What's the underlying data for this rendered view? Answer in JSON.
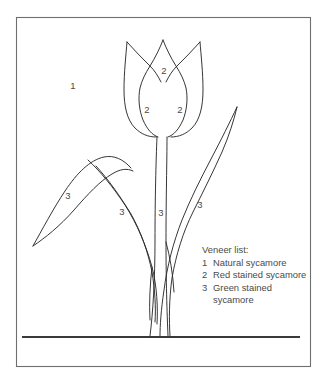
{
  "document": {
    "title": "Tulip marquetry pattern",
    "type": "line-drawing"
  },
  "colors": {
    "outline": "#2b2b2b",
    "frame": "#6d6f71",
    "ground": "#3a3a3a",
    "label_text": "#4a4a4a",
    "background": "#ffffff"
  },
  "frame": {
    "x": 16,
    "y": 17,
    "width": 295,
    "height": 350
  },
  "ground": {
    "x1": 22,
    "x2": 300,
    "y": 337
  },
  "region_labels": [
    {
      "id": "background-region",
      "text": "1",
      "x": 73,
      "y": 86
    },
    {
      "id": "petal-center-top",
      "text": "2",
      "x": 164,
      "y": 71
    },
    {
      "id": "petal-left",
      "text": "2",
      "x": 147,
      "y": 110
    },
    {
      "id": "petal-right",
      "text": "2",
      "x": 180,
      "y": 110
    },
    {
      "id": "leaf-far-left",
      "text": "3",
      "x": 68,
      "y": 196
    },
    {
      "id": "leaf-left",
      "text": "3",
      "x": 122,
      "y": 212
    },
    {
      "id": "stem",
      "text": "3",
      "x": 161,
      "y": 213
    },
    {
      "id": "leaf-right",
      "text": "3",
      "x": 200,
      "y": 205
    }
  ],
  "legend": {
    "title": "Veneer list:",
    "items": [
      {
        "number": "1",
        "label": "Natural sycamore"
      },
      {
        "number": "2",
        "label": "Red stained sycamore"
      },
      {
        "number": "3",
        "label": "Green stained sycamore"
      }
    ]
  },
  "shapes": {
    "tulip_petal_left_outer": "M 127 42 C 126 55 124 72 124 90 C 124 106 127 120 135 128 C 141 134 148 137 156 137",
    "tulip_petal_right_outer": "M 200 42 C 201 55 203 72 203 90 C 203 106 200 120 192 128 C 186 134 179 137 171 137",
    "tulip_notch_left": "M 127 42 C 134 50 142 58 150 66 C 155 71 158 76 161 81",
    "tulip_notch_right": "M 200 42 C 193 50 185 58 177 66 C 172 71 169 76 166 81",
    "tulip_center_petal_left": "M 163 40 C 160 48 155 58 150 66 C 145 74 142 80 140 88 C 138 98 139 110 143 120 C 147 129 152 135 158 137",
    "tulip_center_petal_right": "M 163 40 C 166 48 171 58 176 66 C 181 74 184 80 186 88 C 188 98 187 110 183 120 C 179 129 174 135 168 137",
    "stem_left": "M 157 137 C 156 160 155 200 155 240 C 155 280 153 310 150 336",
    "stem_right": "M 167 137 C 167 160 166 200 166 240 C 166 280 167 310 168 336",
    "leaf_right": "M 237 107 C 234 120 229 136 222 152 C 213 172 203 192 193 212 C 183 232 176 255 172 278 C 169 300 169 320 170 336",
    "leaf_right_inner": "M 237 107 C 230 122 221 140 211 159 C 200 180 190 200 182 220 C 173 243 167 267 164 290 C 161 310 160 326 160 336",
    "leaf_left_upper": "M 33 246 C 42 230 53 209 65 191 C 77 173 90 160 104 157 C 114 155 123 159 131 168",
    "leaf_left_upper_inner": "M 33 246 C 45 238 60 225 74 209 C 88 193 100 180 112 173 C 120 168 127 167 133 170",
    "leaf_left_lower": "M 88 160 C 100 171 113 187 125 205 C 137 224 146 245 152 267 C 157 286 158 306 157 322",
    "leaf_left_lower_inner": "M 96 166 C 108 179 120 196 131 214 C 141 232 148 252 152 272 C 155 288 156 305 155 320",
    "stem_branch_left": "M 152 267 C 150 282 149 302 150 318",
    "stem_branch_right": "M 166 240 C 170 255 173 272 174 290"
  }
}
